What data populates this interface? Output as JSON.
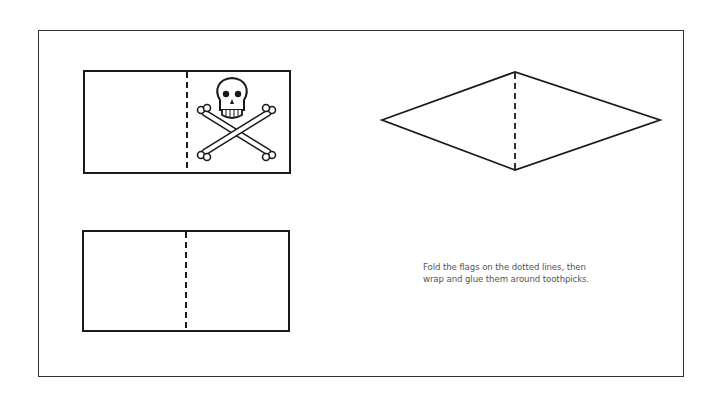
{
  "page": {
    "instructions": {
      "line1": "Fold the flags on the dotted lines, then",
      "line2": "wrap and glue them around toothpicks."
    },
    "flags": [
      {
        "name": "skull-crossbones-flag",
        "shape": "rectangle",
        "has_icon": "skull-and-crossbones-icon"
      },
      {
        "name": "blank-rectangle-flag",
        "shape": "rectangle"
      },
      {
        "name": "diamond-pennant-flag",
        "shape": "diamond"
      }
    ],
    "colors": {
      "line": "#1a1a1a",
      "text": "#555555",
      "background": "#ffffff"
    }
  }
}
